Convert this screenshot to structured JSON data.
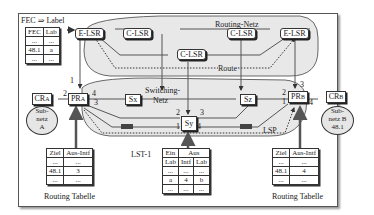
{
  "title": "FEC ⇒ Label",
  "regions": {
    "routing_net": "Routing-Netz",
    "switching_net_1": "Switching-",
    "switching_net_2": "Netz",
    "route": "Route",
    "lsp": "LSP"
  },
  "fec_table": {
    "headers": [
      "FEC",
      "Lab"
    ],
    "rows": [
      [
        "...",
        "..."
      ],
      [
        "48.1",
        "a"
      ],
      [
        "...",
        "..."
      ]
    ]
  },
  "nodes": {
    "e_lsr_left": "E-LSR",
    "e_lsr_right": "E-LSR",
    "c_lsr_1": "C-LSR",
    "c_lsr_2": "C-LSR",
    "c_lsr_3": "C-LSR",
    "sx": "Sx",
    "sy": "Sy",
    "sz": "Sz",
    "pr_a": "PR",
    "pr_a_sub": "A",
    "pr_b": "PR",
    "pr_b_sub": "B",
    "cr_a": "CR",
    "cr_a_sub": "A",
    "cr_b": "CR",
    "cr_b_sub": "B"
  },
  "subnets": {
    "a": [
      "Sub-",
      "netz",
      "A"
    ],
    "b": [
      "Sub-",
      "netz B",
      "48.1"
    ]
  },
  "ports": {
    "pr_a": [
      "1",
      "2",
      "4",
      "3"
    ],
    "pr_b": [
      "3",
      "2",
      "1",
      "4"
    ],
    "sy": [
      "2",
      "3",
      "1",
      "4"
    ],
    "sx_left": "3",
    "sx_left2": "4",
    "sz_right": "2",
    "sz_right2": "1"
  },
  "routing_table_a": {
    "headers": [
      "Ziel",
      "Aus-Intf"
    ],
    "rows": [
      [
        "...",
        "..."
      ],
      [
        "48.1",
        "3"
      ],
      [
        "...",
        "..."
      ]
    ],
    "caption": "Routing Tabelle"
  },
  "routing_table_b": {
    "headers": [
      "Ziel",
      "Aus-Intf"
    ],
    "rows": [
      [
        "...",
        "..."
      ],
      [
        "48.1",
        "4"
      ],
      [
        "...",
        "..."
      ]
    ],
    "caption": "Routing Tabelle"
  },
  "lst_table": {
    "label": "LST-1",
    "group_headers": [
      "Ein",
      "Aus"
    ],
    "headers": [
      "Lab",
      "Intf",
      "Lab"
    ],
    "rows": [
      [
        "...",
        "...",
        "..."
      ],
      [
        "a",
        "4",
        "b"
      ],
      [
        "...",
        "...",
        "..."
      ]
    ]
  }
}
